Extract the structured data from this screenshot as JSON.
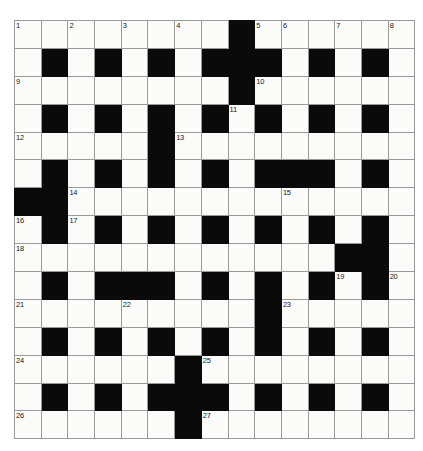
{
  "puzzle": {
    "type": "crossword-grid",
    "title": "Crossword puzzle grid",
    "rows": 15,
    "cols": 15,
    "colors": {
      "block": "#0a0a0a",
      "cell": "#fbfbf9",
      "grid_line": "#9a9a9a",
      "number_text": "#1a1a1a",
      "page_background": "#ffffff"
    },
    "cell_size_px": 25.7,
    "numbered_cells": [
      {
        "number": "1",
        "row": 1,
        "col": 1
      },
      {
        "number": "2",
        "row": 1,
        "col": 3
      },
      {
        "number": "3",
        "row": 1,
        "col": 5
      },
      {
        "number": "4",
        "row": 1,
        "col": 7
      },
      {
        "number": "5",
        "row": 1,
        "col": 10
      },
      {
        "number": "6",
        "row": 1,
        "col": 11
      },
      {
        "number": "7",
        "row": 1,
        "col": 13
      },
      {
        "number": "8",
        "row": 1,
        "col": 15
      },
      {
        "number": "9",
        "row": 3,
        "col": 1
      },
      {
        "number": "10",
        "row": 3,
        "col": 10
      },
      {
        "number": "11",
        "row": 4,
        "col": 9
      },
      {
        "number": "12",
        "row": 5,
        "col": 1
      },
      {
        "number": "13",
        "row": 5,
        "col": 7
      },
      {
        "number": "14",
        "row": 7,
        "col": 3
      },
      {
        "number": "15",
        "row": 7,
        "col": 11
      },
      {
        "number": "16",
        "row": 8,
        "col": 1
      },
      {
        "number": "17",
        "row": 8,
        "col": 3
      },
      {
        "number": "18",
        "row": 9,
        "col": 1
      },
      {
        "number": "19",
        "row": 10,
        "col": 13
      },
      {
        "number": "20",
        "row": 10,
        "col": 15
      },
      {
        "number": "21",
        "row": 11,
        "col": 1
      },
      {
        "number": "22",
        "row": 11,
        "col": 5
      },
      {
        "number": "23",
        "row": 11,
        "col": 11
      },
      {
        "number": "24",
        "row": 13,
        "col": 1
      },
      {
        "number": "25",
        "row": 13,
        "col": 8
      },
      {
        "number": "26",
        "row": 15,
        "col": 1
      },
      {
        "number": "27",
        "row": 15,
        "col": 8
      }
    ],
    "grid": [
      [
        0,
        0,
        0,
        0,
        0,
        0,
        0,
        0,
        1,
        0,
        0,
        0,
        0,
        0,
        0
      ],
      [
        0,
        1,
        0,
        1,
        0,
        1,
        0,
        1,
        1,
        1,
        0,
        1,
        0,
        1,
        0
      ],
      [
        0,
        0,
        0,
        0,
        0,
        0,
        0,
        0,
        1,
        0,
        0,
        0,
        0,
        0,
        0
      ],
      [
        0,
        1,
        0,
        1,
        0,
        1,
        0,
        1,
        0,
        1,
        0,
        1,
        0,
        1,
        0
      ],
      [
        0,
        0,
        0,
        0,
        0,
        1,
        0,
        0,
        0,
        0,
        0,
        0,
        0,
        0,
        0
      ],
      [
        0,
        1,
        0,
        1,
        0,
        1,
        0,
        1,
        0,
        1,
        1,
        1,
        0,
        1,
        0
      ],
      [
        1,
        1,
        0,
        0,
        0,
        0,
        0,
        0,
        0,
        0,
        0,
        0,
        0,
        0,
        0
      ],
      [
        0,
        1,
        0,
        1,
        0,
        1,
        0,
        1,
        0,
        1,
        0,
        1,
        0,
        1,
        0
      ],
      [
        0,
        0,
        0,
        0,
        0,
        0,
        0,
        0,
        0,
        0,
        0,
        0,
        1,
        1,
        0
      ],
      [
        0,
        1,
        0,
        1,
        1,
        1,
        0,
        1,
        0,
        1,
        0,
        1,
        0,
        1,
        0
      ],
      [
        0,
        0,
        0,
        0,
        0,
        0,
        0,
        0,
        0,
        1,
        0,
        0,
        0,
        0,
        0
      ],
      [
        0,
        1,
        0,
        1,
        0,
        1,
        0,
        1,
        0,
        1,
        0,
        1,
        0,
        1,
        0
      ],
      [
        0,
        0,
        0,
        0,
        0,
        0,
        1,
        0,
        0,
        0,
        0,
        0,
        0,
        0,
        0
      ],
      [
        0,
        1,
        0,
        1,
        0,
        1,
        1,
        1,
        0,
        1,
        0,
        1,
        0,
        1,
        0
      ],
      [
        0,
        0,
        0,
        0,
        0,
        0,
        1,
        0,
        0,
        0,
        0,
        0,
        0,
        0,
        0
      ]
    ]
  }
}
